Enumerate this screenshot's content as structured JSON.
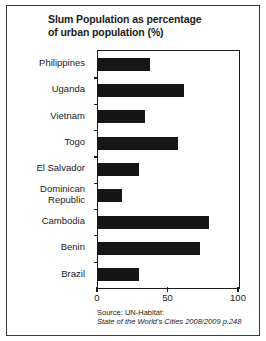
{
  "figure": {
    "title_line1": "Slum Population as percentage",
    "title_line2": "of urban population (%)",
    "source_line1": "Source: UN-Habitat:",
    "source_line2": "State of the World's Cities 2008/2009 p.248",
    "bar_color": "#161616",
    "axis_color": "#1b1b1b",
    "background": "#ffffff"
  },
  "chart_data": {
    "type": "bar",
    "orientation": "horizontal",
    "title": "Slum Population as percentage of urban population (%)",
    "xlabel": "",
    "ylabel": "",
    "xlim": [
      0,
      100
    ],
    "xticks": [
      0,
      50,
      100
    ],
    "xtick_labels": [
      "0",
      "50",
      "100"
    ],
    "grid": false,
    "legend": false,
    "categories": [
      "Philippines",
      "Uganda",
      "Vietnam",
      "Togo",
      "El Salvador",
      "Dominican Republic",
      "Cambodia",
      "Benin",
      "Brazil"
    ],
    "category_lines": [
      [
        "Philippines"
      ],
      [
        "Uganda"
      ],
      [
        "Vietnam"
      ],
      [
        "Togo"
      ],
      [
        "El Salvador"
      ],
      [
        "Dominican",
        "Republic"
      ],
      [
        "Cambodia"
      ],
      [
        "Benin"
      ],
      [
        "Brazil"
      ]
    ],
    "values": [
      37,
      61,
      33,
      57,
      29,
      17,
      79,
      72,
      29
    ]
  }
}
